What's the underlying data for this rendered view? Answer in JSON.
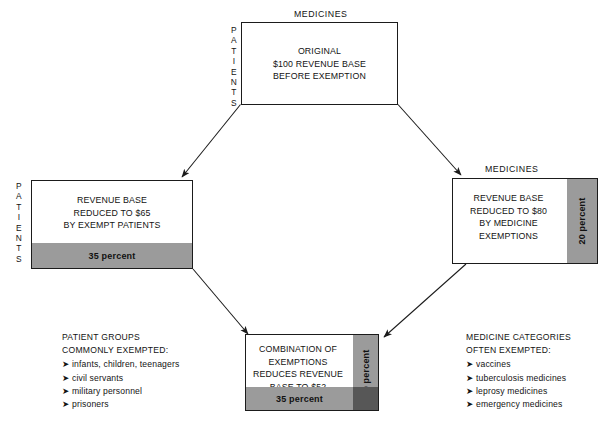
{
  "diagram": {
    "colors": {
      "band_gray": "#9b9b9b",
      "band_overlap_gray": "#575757",
      "box_border": "#1b1b1b",
      "text": "#131313",
      "background": "#ffffff"
    },
    "boxes": [
      {
        "id": "original",
        "caption_top": "MEDICINES",
        "side_label": "PATIENTS",
        "lines": [
          "ORIGINAL",
          "$100 REVENUE BASE",
          "BEFORE EXEMPTION"
        ],
        "bands": []
      },
      {
        "id": "patients-exempt",
        "caption_top": "",
        "side_label": "PATIENTS",
        "lines": [
          "REVENUE BASE",
          "REDUCED TO $65",
          "BY EXEMPT PATIENTS"
        ],
        "bands": [
          {
            "orientation": "horizontal",
            "label": "35 percent"
          }
        ]
      },
      {
        "id": "medicines-exempt",
        "caption_top": "MEDICINES",
        "side_label": "",
        "lines": [
          "REVENUE BASE",
          "REDUCED TO $80",
          "BY MEDICINE",
          "EXEMPTIONS"
        ],
        "bands": [
          {
            "orientation": "vertical",
            "label": "20 percent"
          }
        ]
      },
      {
        "id": "combination",
        "caption_top": "",
        "side_label": "",
        "lines": [
          "COMBINATION OF",
          "EXEMPTIONS",
          "REDUCES REVENUE",
          "BASE TO $52"
        ],
        "bands": [
          {
            "orientation": "vertical",
            "label": "20 percent"
          },
          {
            "orientation": "horizontal",
            "label": "35 percent"
          }
        ]
      }
    ],
    "notes": [
      {
        "id": "patient-groups",
        "heading": [
          "PATIENT GROUPS",
          "COMMONLY EXEMPTED:"
        ],
        "bullet_glyph": "➤",
        "items": [
          "infants, children, teenagers",
          "civil servants",
          "military personnel",
          "prisoners"
        ]
      },
      {
        "id": "medicine-categories",
        "heading": [
          "MEDICINE CATEGORIES",
          "OFTEN EXEMPTED:"
        ],
        "bullet_glyph": "➤",
        "items": [
          "vaccines",
          "tuberculosis medicines",
          "leprosy medicines",
          "emergency medicines"
        ]
      }
    ]
  }
}
